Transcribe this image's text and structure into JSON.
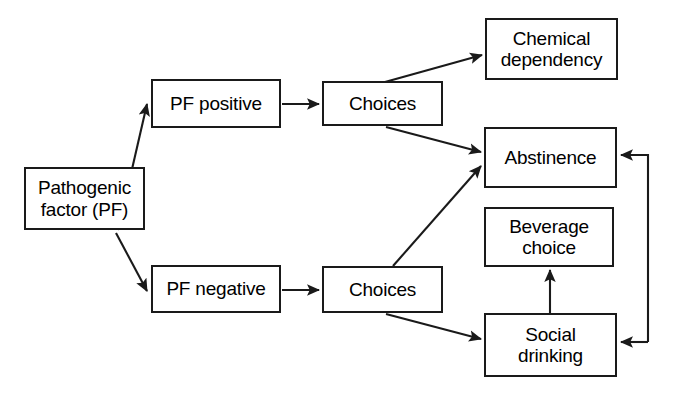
{
  "diagram": {
    "type": "flowchart",
    "background_color": "#ffffff",
    "stroke_color": "#1a1a1a",
    "text_color": "#000000",
    "nodes": [
      {
        "id": "pathogenic_factor",
        "label": "Pathogenic\nfactor (PF)",
        "x": 24,
        "y": 167,
        "width": 121,
        "height": 63
      },
      {
        "id": "pf_positive",
        "label": "PF positive",
        "x": 151,
        "y": 79,
        "width": 130,
        "height": 49
      },
      {
        "id": "pf_negative",
        "label": "PF negative",
        "x": 151,
        "y": 265,
        "width": 130,
        "height": 48
      },
      {
        "id": "choices_upper",
        "label": "Choices",
        "x": 322,
        "y": 81,
        "width": 121,
        "height": 45
      },
      {
        "id": "choices_lower",
        "label": "Choices",
        "x": 322,
        "y": 266,
        "width": 121,
        "height": 47
      },
      {
        "id": "chemical_dependency",
        "label": "Chemical\ndependency",
        "x": 485,
        "y": 18,
        "width": 133,
        "height": 62
      },
      {
        "id": "abstinence",
        "label": "Abstinence",
        "x": 484,
        "y": 127,
        "width": 133,
        "height": 61
      },
      {
        "id": "beverage_choice",
        "label": "Beverage\nchoice",
        "x": 484,
        "y": 207,
        "width": 130,
        "height": 60
      },
      {
        "id": "social_drinking",
        "label": "Social\ndrinking",
        "x": 484,
        "y": 313,
        "width": 133,
        "height": 64
      }
    ],
    "edges": [
      {
        "id": "pf-to-pf-positive",
        "from": "pathogenic_factor",
        "to": "pf_positive",
        "style": "diagonal-up"
      },
      {
        "id": "pf-to-pf-negative",
        "from": "pathogenic_factor",
        "to": "pf_negative",
        "style": "diagonal-down"
      },
      {
        "id": "pf-positive-to-choices",
        "from": "pf_positive",
        "to": "choices_upper",
        "style": "straight"
      },
      {
        "id": "pf-negative-to-choices",
        "from": "pf_negative",
        "to": "choices_lower",
        "style": "straight"
      },
      {
        "id": "choices-upper-to-chemical-dependency",
        "from": "choices_upper",
        "to": "chemical_dependency",
        "style": "diagonal-up"
      },
      {
        "id": "choices-upper-to-abstinence",
        "from": "choices_upper",
        "to": "abstinence",
        "style": "diagonal-down"
      },
      {
        "id": "choices-lower-to-abstinence",
        "from": "choices_lower",
        "to": "abstinence",
        "style": "diagonal-up"
      },
      {
        "id": "choices-lower-to-social-drinking",
        "from": "choices_lower",
        "to": "social_drinking",
        "style": "diagonal-down"
      },
      {
        "id": "social-drinking-to-beverage-choice",
        "from": "social_drinking",
        "to": "beverage_choice",
        "style": "vertical-up"
      },
      {
        "id": "feedback-to-abstinence",
        "from": "social_drinking",
        "to": "abstinence",
        "style": "elbow-right"
      },
      {
        "id": "feedback-to-social-drinking",
        "from": "social_drinking",
        "to": "social_drinking",
        "style": "elbow-right"
      }
    ]
  }
}
